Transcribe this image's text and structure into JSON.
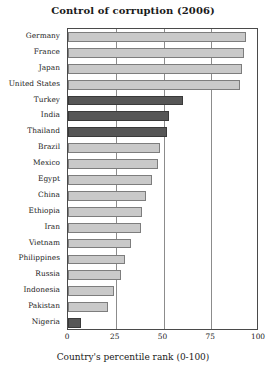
{
  "chart_data": {
    "type": "bar",
    "orientation": "horizontal",
    "title": "Control of corruption (2006)",
    "xlabel": "Country's percentile rank (0-100)",
    "ylabel": "",
    "xlim": [
      0,
      100
    ],
    "xticks": [
      "0",
      "25",
      "50",
      "75",
      "100"
    ],
    "xtick_values": [
      0,
      25,
      50,
      75,
      100
    ],
    "grid": true,
    "legend": "none",
    "categories": [
      "Germany",
      "France",
      "Japan",
      "United States",
      "Turkey",
      "India",
      "Thailand",
      "Brazil",
      "Mexico",
      "Egypt",
      "China",
      "Ethiopia",
      "Iran",
      "Vietnam",
      "Philippines",
      "Russia",
      "Indonesia",
      "Pakistan",
      "Nigeria"
    ],
    "values": [
      93,
      92,
      91,
      90,
      60,
      53,
      52,
      48,
      47,
      44,
      41,
      39,
      38,
      33,
      30,
      28,
      24,
      21,
      7
    ],
    "highlighted": [
      "Turkey",
      "India",
      "Thailand",
      "Nigeria"
    ],
    "colors": {
      "bar_normal": "#c9c9c9",
      "bar_highlight": "#565656",
      "bar_border_normal": "#7d7d7d",
      "bar_border_highlight": "#3a3a3a",
      "gridline": "#8c8c8c",
      "axis": "#4a4a4a",
      "text": "#1a1a1a",
      "background": "#ffffff"
    }
  }
}
